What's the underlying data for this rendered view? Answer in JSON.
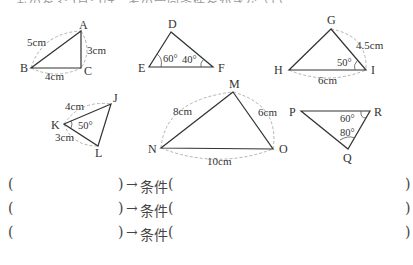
{
  "header": {
    "fragment": "ものを3つ見つけ、その合同条件をかきなさい。"
  },
  "triangles": [
    {
      "id": "ABC",
      "vertices": {
        "A": "A",
        "B": "B",
        "C": "C"
      },
      "measures": [
        "5cm",
        "3cm",
        "4cm"
      ]
    },
    {
      "id": "DEF",
      "vertices": {
        "D": "D",
        "E": "E",
        "F": "F"
      },
      "angles": [
        "60°",
        "40°"
      ]
    },
    {
      "id": "GHI",
      "vertices": {
        "G": "G",
        "H": "H",
        "I": "I"
      },
      "measures": [
        "4.5cm",
        "6cm"
      ],
      "angles": [
        "50°"
      ]
    },
    {
      "id": "JKL",
      "vertices": {
        "J": "J",
        "K": "K",
        "L": "L"
      },
      "measures": [
        "4cm",
        "3cm"
      ],
      "angles": [
        "50°"
      ]
    },
    {
      "id": "MNO",
      "vertices": {
        "M": "M",
        "N": "N",
        "O": "O"
      },
      "measures": [
        "8cm",
        "6cm",
        "10cm"
      ]
    },
    {
      "id": "PQR",
      "vertices": {
        "P": "P",
        "Q": "Q",
        "R": "R"
      },
      "angles": [
        "60°",
        "80°"
      ]
    }
  ],
  "answer_rows": [
    {
      "open": "(",
      "close": ")",
      "arrow": "→",
      "condition_label": "条件",
      "cond_open": "(",
      "cond_close": ")"
    },
    {
      "open": "(",
      "close": ")",
      "arrow": "→",
      "condition_label": "条件",
      "cond_open": "(",
      "cond_close": ")"
    },
    {
      "open": "(",
      "close": ")",
      "arrow": "→",
      "condition_label": "条件",
      "cond_open": "(",
      "cond_close": ")"
    }
  ]
}
